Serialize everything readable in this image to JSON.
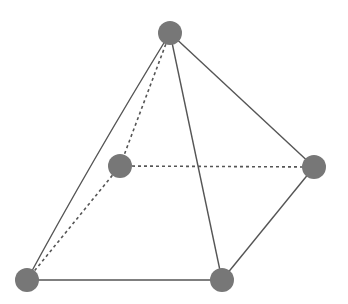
{
  "diagram": {
    "type": "square-pyramid-wireframe",
    "background": "#ffffff",
    "node_color": "#777777",
    "edge_color": "#555555",
    "node_radius": 12,
    "nodes": [
      {
        "id": "apex",
        "x": 170,
        "y": 33
      },
      {
        "id": "back-left",
        "x": 120,
        "y": 166
      },
      {
        "id": "right",
        "x": 314,
        "y": 167
      },
      {
        "id": "front-left",
        "x": 27,
        "y": 280
      },
      {
        "id": "front-right",
        "x": 222,
        "y": 280
      }
    ],
    "edges": [
      {
        "from": "apex",
        "to": "front-left",
        "style": "solid",
        "curved": true
      },
      {
        "from": "apex",
        "to": "front-right",
        "style": "solid"
      },
      {
        "from": "apex",
        "to": "right",
        "style": "solid"
      },
      {
        "from": "right",
        "to": "front-right",
        "style": "solid"
      },
      {
        "from": "front-left",
        "to": "front-right",
        "style": "solid"
      },
      {
        "from": "apex",
        "to": "back-left",
        "style": "dashed"
      },
      {
        "from": "back-left",
        "to": "front-left",
        "style": "dashed"
      },
      {
        "from": "back-left",
        "to": "right",
        "style": "dashed"
      }
    ]
  }
}
